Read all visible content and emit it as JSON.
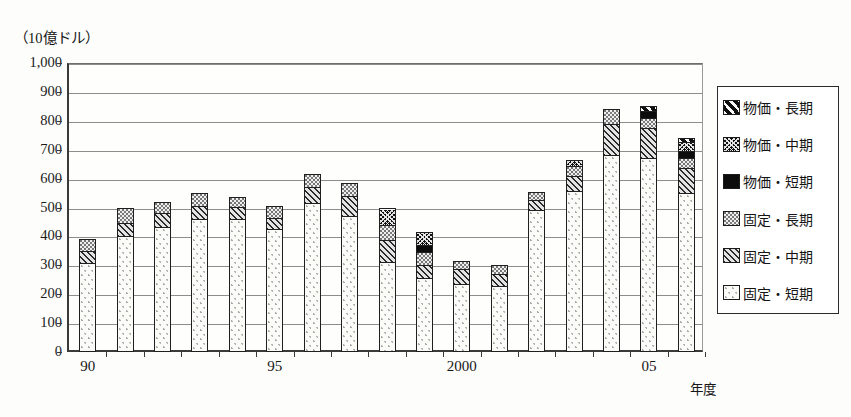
{
  "chart_data": {
    "type": "bar",
    "title": "",
    "subtitle": "",
    "unit_label": "（10億ドル）",
    "xlabel": "年度",
    "ylabel": "",
    "ylim": [
      0,
      1000
    ],
    "ytick_step": 100,
    "grid": true,
    "stacked": true,
    "legend_position": "right-outside",
    "ytick_labels": [
      "1,000",
      "900",
      "800",
      "700",
      "600",
      "500",
      "400",
      "300",
      "200",
      "100",
      "0"
    ],
    "ytick_values": [
      1000,
      900,
      800,
      700,
      600,
      500,
      400,
      300,
      200,
      100,
      0
    ],
    "categories": [
      "90",
      "91",
      "92",
      "93",
      "94",
      "95",
      "96",
      "97",
      "98",
      "99",
      "2000",
      "01",
      "02",
      "03",
      "04",
      "05",
      "06"
    ],
    "xtick_labels": [
      {
        "category": "90",
        "label": "90"
      },
      {
        "category": "95",
        "label": "95"
      },
      {
        "category": "2000",
        "label": "2000"
      },
      {
        "category": "05",
        "label": "05"
      }
    ],
    "series": [
      {
        "name": "固定・短期",
        "pattern": "sparse-dots-on-white",
        "values": [
          305,
          400,
          430,
          460,
          460,
          425,
          515,
          470,
          310,
          255,
          235,
          225,
          490,
          555,
          680,
          670,
          550
        ]
      },
      {
        "name": "固定・中期",
        "pattern": "dense-diagonal-hatch",
        "values": [
          45,
          45,
          50,
          45,
          40,
          40,
          55,
          70,
          75,
          45,
          50,
          45,
          35,
          55,
          110,
          105,
          85
        ]
      },
      {
        "name": "固定・長期",
        "pattern": "light-stipple",
        "values": [
          40,
          55,
          40,
          45,
          35,
          40,
          45,
          45,
          55,
          45,
          30,
          30,
          30,
          35,
          50,
          35,
          35
        ]
      },
      {
        "name": "物価・短期",
        "pattern": "solid-black",
        "values": [
          0,
          0,
          0,
          0,
          0,
          0,
          0,
          0,
          0,
          25,
          0,
          0,
          0,
          0,
          0,
          25,
          25
        ]
      },
      {
        "name": "物価・中期",
        "pattern": "fine-cross-hatch",
        "values": [
          0,
          0,
          0,
          0,
          0,
          0,
          0,
          0,
          55,
          45,
          0,
          0,
          0,
          20,
          0,
          0,
          30
        ]
      },
      {
        "name": "物価・長期",
        "pattern": "thick-white-diagonals",
        "values": [
          0,
          0,
          0,
          0,
          0,
          0,
          0,
          0,
          0,
          0,
          0,
          0,
          0,
          0,
          0,
          15,
          15
        ]
      }
    ],
    "totals": [
      390,
      500,
      520,
      550,
      535,
      505,
      615,
      585,
      500,
      415,
      315,
      300,
      555,
      665,
      840,
      850,
      740
    ]
  },
  "legend": {
    "items": [
      {
        "label": "物価・長期",
        "pattern": "thick-white-diagonals"
      },
      {
        "label": "物価・中期",
        "pattern": "fine-cross-hatch"
      },
      {
        "label": "物価・短期",
        "pattern": "solid-black"
      },
      {
        "label": "固定・長期",
        "pattern": "light-stipple"
      },
      {
        "label": "固定・中期",
        "pattern": "dense-diagonal-hatch"
      },
      {
        "label": "固定・短期",
        "pattern": "sparse-dots-on-white"
      }
    ]
  },
  "colors": {
    "axis": "#3a3a3a",
    "grid": "#8d8d8d",
    "ink": "#1d1d1d",
    "background": "#fdfdfb"
  }
}
